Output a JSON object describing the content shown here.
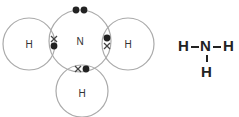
{
  "diagram": {
    "colors": {
      "circle_stroke": "#aaaaaa",
      "dot": "#222222",
      "cross": "#444444",
      "label": "#333333"
    },
    "atoms": [
      {
        "id": "N",
        "label": "N",
        "cx": 80,
        "cy": 41,
        "r": 31
      },
      {
        "id": "H-left",
        "label": "H",
        "cx": 29,
        "cy": 44,
        "r": 26
      },
      {
        "id": "H-right",
        "label": "H",
        "cx": 128,
        "cy": 44,
        "r": 26
      },
      {
        "id": "H-bottom",
        "label": "H",
        "cx": 82,
        "cy": 91,
        "r": 26
      }
    ],
    "electrons": {
      "lone_pair": [
        {
          "type": "dot",
          "x": 76,
          "y": 10
        },
        {
          "type": "dot",
          "x": 84,
          "y": 10
        }
      ],
      "bond_left": [
        {
          "type": "cross",
          "x": 54,
          "y": 39
        },
        {
          "type": "dot",
          "x": 54,
          "y": 46
        }
      ],
      "bond_right": [
        {
          "type": "dot",
          "x": 107,
          "y": 38
        },
        {
          "type": "cross",
          "x": 107,
          "y": 46
        }
      ],
      "bond_bottom": [
        {
          "type": "cross",
          "x": 78,
          "y": 69
        },
        {
          "type": "dot",
          "x": 86,
          "y": 69
        }
      ]
    }
  },
  "structural_formula": {
    "left": "H",
    "center": "N",
    "right": "H",
    "bottom": "H"
  }
}
